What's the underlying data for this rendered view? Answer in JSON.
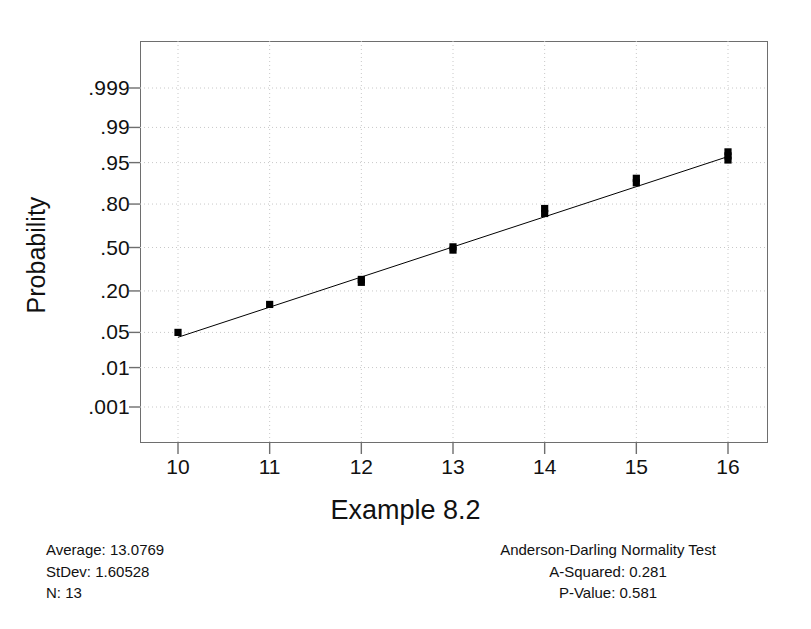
{
  "chart_data": {
    "type": "scatter",
    "title": "",
    "xlabel": "Example 8.2",
    "ylabel": "Probability",
    "plot_kind": "normal-probability-plot",
    "grid": true,
    "legend": "none",
    "xlim": [
      9.4,
      16.4
    ],
    "ylim_probability": [
      0.0005,
      0.9995
    ],
    "x_ticks": [
      "10",
      "11",
      "12",
      "13",
      "14",
      "15",
      "16"
    ],
    "x_tick_values": [
      10,
      11,
      12,
      13,
      14,
      15,
      16
    ],
    "y_ticks": [
      ".999",
      ".99",
      ".95",
      ".80",
      ".50",
      ".20",
      ".05",
      ".01",
      ".001"
    ],
    "y_tick_values": [
      0.999,
      0.99,
      0.95,
      0.8,
      0.5,
      0.2,
      0.05,
      0.01,
      0.001
    ],
    "series": [
      {
        "name": "observations",
        "marker": "filled-square",
        "color": "#000000",
        "points": [
          {
            "x": 10.0,
            "p": 0.05
          },
          {
            "x": 11.0,
            "p": 0.135
          },
          {
            "x": 12.0,
            "p": 0.25
          },
          {
            "x": 12.0,
            "p": 0.268
          },
          {
            "x": 13.0,
            "p": 0.48
          },
          {
            "x": 13.0,
            "p": 0.505
          },
          {
            "x": 14.0,
            "p": 0.745
          },
          {
            "x": 14.0,
            "p": 0.775
          },
          {
            "x": 15.0,
            "p": 0.895
          },
          {
            "x": 15.0,
            "p": 0.91
          },
          {
            "x": 16.0,
            "p": 0.955
          },
          {
            "x": 16.0,
            "p": 0.962
          },
          {
            "x": 16.0,
            "p": 0.968
          }
        ]
      },
      {
        "name": "fitted-normal-line",
        "type": "line",
        "color": "#000000",
        "endpoints": [
          {
            "x": 10.0,
            "p": 0.041
          },
          {
            "x": 16.0,
            "p": 0.961
          }
        ]
      }
    ]
  },
  "axes": {
    "y_title": "Probability",
    "x_title": "Example 8.2"
  },
  "footer_left": {
    "average_label": "Average: 13.0769",
    "stdev_label": "StDev: 1.60528",
    "n_label": "N: 13"
  },
  "footer_right": {
    "test_title": "Anderson-Darling Normality Test",
    "a_squared_label": "A-Squared: 0.281",
    "p_value_label": "P-Value:   0.581"
  },
  "colors": {
    "frame": "#6e6e6e",
    "grid": "#c8c8c8",
    "marker": "#000000",
    "text": "#111111",
    "background": "#ffffff"
  }
}
